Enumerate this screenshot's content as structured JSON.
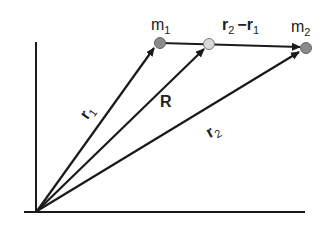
{
  "diagram": {
    "labels": {
      "m1": {
        "base": "m",
        "sub": "1"
      },
      "m2": {
        "base": "m",
        "sub": "2"
      },
      "r1": {
        "base": "r",
        "sub": "1"
      },
      "r2": {
        "base": "r",
        "sub": "2"
      },
      "R": "R",
      "rel": {
        "a": "r",
        "a_sub": "2",
        "op": "−",
        "b": "r",
        "b_sub": "1"
      }
    },
    "colors": {
      "line": "#1a1a1a",
      "mass": "#8a8a8a",
      "com": "#d9d9d9"
    }
  }
}
